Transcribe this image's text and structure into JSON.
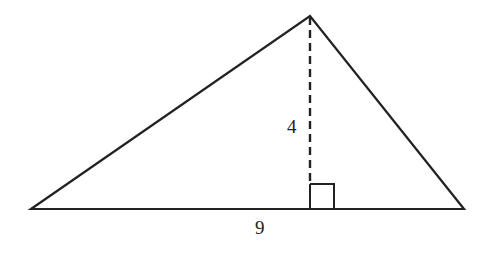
{
  "diagram": {
    "type": "triangle",
    "vertices": {
      "left": [
        31,
        209
      ],
      "apex": [
        310,
        16
      ],
      "right": [
        464,
        209
      ]
    },
    "altitude_foot": [
      310,
      209
    ],
    "labels": {
      "height": "4",
      "base": "9"
    },
    "colors": {
      "stroke": "#222222",
      "background": "#ffffff"
    }
  }
}
